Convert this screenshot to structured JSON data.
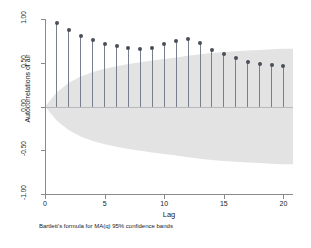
{
  "chart_data": {
    "type": "bar",
    "title": "",
    "subtitle": "",
    "xlabel": "Lag",
    "ylabel": "Autocorrelations of air",
    "note": "Bartlett's formula for MA(q) 95% confidence bands",
    "xlim": [
      0,
      20.8
    ],
    "ylim": [
      -1.0,
      1.0
    ],
    "grid": false,
    "legend": "none",
    "xticks": [
      0,
      5,
      10,
      15,
      20
    ],
    "xtick_labels": [
      "0",
      "5",
      "10",
      "15",
      "20"
    ],
    "yticks": [
      1.0,
      0.5,
      0.0,
      -0.5,
      -1.0
    ],
    "ytick_labels": [
      "1.00",
      "0.50",
      "0.00",
      "-0.50",
      "-1.00"
    ],
    "x": [
      1,
      2,
      3,
      4,
      5,
      6,
      7,
      8,
      9,
      10,
      11,
      12,
      13,
      14,
      15,
      16,
      17,
      18,
      19,
      20
    ],
    "series": [
      {
        "name": "Autocorrelations of air",
        "values": [
          0.95,
          0.88,
          0.81,
          0.76,
          0.72,
          0.69,
          0.67,
          0.66,
          0.67,
          0.71,
          0.75,
          0.77,
          0.73,
          0.65,
          0.6,
          0.55,
          0.51,
          0.49,
          0.47,
          0.46
        ]
      }
    ],
    "confidence_band": {
      "label": "Bartlett 95% confidence band",
      "upper": [
        0.163,
        0.272,
        0.343,
        0.393,
        0.431,
        0.461,
        0.486,
        0.507,
        0.525,
        0.543,
        0.561,
        0.58,
        0.597,
        0.611,
        0.622,
        0.632,
        0.64,
        0.647,
        0.654,
        0.66
      ],
      "lower": [
        -0.163,
        -0.272,
        -0.343,
        -0.393,
        -0.431,
        -0.461,
        -0.486,
        -0.507,
        -0.525,
        -0.543,
        -0.561,
        -0.58,
        -0.597,
        -0.611,
        -0.622,
        -0.632,
        -0.64,
        -0.647,
        -0.654,
        -0.66
      ],
      "color": "#e3e3e3"
    },
    "marker_color": "#4a4f57",
    "stem_color": "#777f8c",
    "axis_color": "#8a8a8a",
    "background": "#ffffff"
  }
}
